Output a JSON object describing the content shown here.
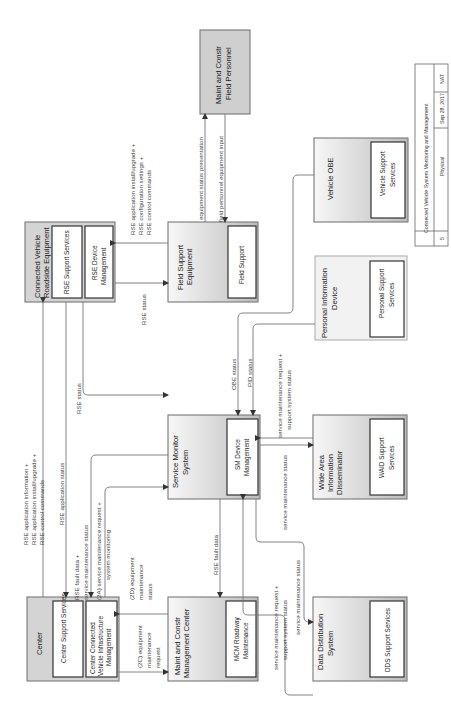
{
  "diagram": {
    "orientation": "rotated-90-ccw",
    "title_block": {
      "title": "Connected Vehicle System Monitoring and Management",
      "view": "Physical",
      "date": "Sep 28, 2017",
      "author": "NAT",
      "page": "5"
    },
    "nodes": {
      "center": {
        "title": "Center",
        "sub1": "Center Support Services",
        "sub2a": "Center Connected",
        "sub2b": "Vehicle Infrastructure",
        "sub2c": "Management"
      },
      "rse": {
        "title_a": "Connected Vehicle",
        "title_b": "Roadside Equipment",
        "sub1": "RSE Support Services",
        "sub2a": "RSE Device",
        "sub2b": "Management"
      },
      "field_support": {
        "title_a": "Field Support",
        "title_b": "Equipment",
        "sub1": "Field Support"
      },
      "field_personnel": {
        "title_a": "Maint and Constr",
        "title_b": "Field Personnel"
      },
      "mcm": {
        "title_a": "Maint and Constr",
        "title_b": "Management Center",
        "sub1a": "MCM Roadway",
        "sub1b": "Maintenance"
      },
      "sms": {
        "title_a": "Service Monitor",
        "title_b": "System",
        "sub1a": "SM Device",
        "sub1b": "Management"
      },
      "dds": {
        "title_a": "Data Distribution",
        "title_b": "System",
        "sub1": "DDS Support Services"
      },
      "waid": {
        "title_a": "Wide Area",
        "title_b": "Information",
        "title_c": "Disseminator",
        "sub1a": "WAID Support",
        "sub1b": "Services"
      },
      "pid": {
        "title_a": "Personal Information",
        "title_b": "Device",
        "sub1a": "Personal Support",
        "sub1b": "Services"
      },
      "obe": {
        "title": "Vehicle OBE",
        "sub1a": "Vehicle Support",
        "sub1b": "Services"
      }
    },
    "flows": {
      "center_rse_1a": "RSE application information +",
      "center_rse_1b": "RSE application install/upgrade +",
      "center_rse_1c": "RSE control commands",
      "rse_center_status": "RSE application status",
      "rse_sms_status": "RSE status",
      "sms_center_a": "RSE fault data +",
      "sms_center_b": "service maintenance status",
      "center_sms_a": "(2A) service maintenance request +",
      "center_sms_b": "system monitoring",
      "mcm_center_a": "(2D) equipment",
      "mcm_center_b": "maintenance",
      "mcm_center_c": "status",
      "center_mcm_a": "(2C) equipment",
      "center_mcm_b": "maintenance",
      "center_mcm_c": "request",
      "sms_mcm": "RSE fault data",
      "fse_rse_a": "RSE application install/upgrade +",
      "fse_rse_b": "RSE configuration settings +",
      "fse_rse_c": "RSE control commands",
      "rse_fse_status": "RSE status",
      "fse_personnel": "equipment status presentation",
      "personnel_fse": "field personnel equipment input",
      "obe_sms": "OBE status",
      "pid_sms": "PID status",
      "waid_sms_a": "service maintenance request +",
      "waid_sms_b": "support system status",
      "sms_waid": "service maintenance status",
      "dds_sms_a": "service maintenance request +",
      "dds_sms_b": "support system status",
      "sms_dds": "service maintenance status"
    }
  }
}
